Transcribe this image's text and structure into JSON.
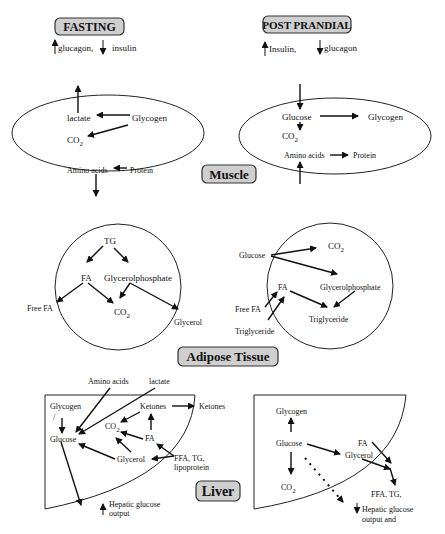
{
  "header": {
    "fasting": {
      "title": "FASTING",
      "hormones": "glucagon,",
      "hormone2": "insulin"
    },
    "postprandial": {
      "title": "POST PRANDIAL",
      "hormones": "Insulin,",
      "hormone2": "glucagon"
    }
  },
  "tissues": {
    "muscle": "Muscle",
    "adipose": "Adipose Tissue",
    "liver": "Liver"
  },
  "muscle": {
    "fasting": {
      "lactate": "lactate",
      "glycogen": "Glycogen",
      "co2": "CO",
      "sub2": "2",
      "amino": "Amino acids",
      "protein": "Protein"
    },
    "fed": {
      "glucose": "Glucose",
      "glycogen": "Glycogen",
      "co2": "CO",
      "sub2": "2",
      "amino": "Amino acids",
      "protein": "Protein"
    }
  },
  "adipose": {
    "fasting": {
      "tg": "TG",
      "fa": "FA",
      "gp": "Glycerolphosphate",
      "freefa": "Free FA",
      "co2": "CO",
      "sub2": "2",
      "glycerol": "Glycerol"
    },
    "fed": {
      "glucose": "Glucose",
      "co2": "CO",
      "sub2": "2",
      "fa": "FA",
      "gp": "Glycerolphosphate",
      "freefa": "Free FA",
      "trig_in": "Triglyceride",
      "trig": "Triglyceride"
    }
  },
  "liver": {
    "fasting": {
      "amino": "Amino acids",
      "lactate": "lactate",
      "glycogen": "Glycogen",
      "glucose": "Glucose",
      "ketones": "Ketones",
      "ketones_out": "Ketones",
      "co2": "CO",
      "sub2": "2",
      "fa": "FA",
      "glycerol": "Glycerol",
      "ffa1": "FFA, TG,",
      "ffa2": "lipoprotein",
      "hgo1": "Hepatic glucose",
      "hgo2": "output"
    },
    "fed": {
      "glycogen": "Glycogen",
      "glucose": "Glucose",
      "fa": "FA",
      "glycerol": "Glycerol",
      "co2": "CO",
      "sub2": "2",
      "ffa": "FFA, TG,",
      "hgo1": "Hepatic glucose",
      "hgo2": "output and"
    }
  },
  "glyphs": {
    "up": "↑",
    "down": "↓",
    "slash": "/"
  }
}
